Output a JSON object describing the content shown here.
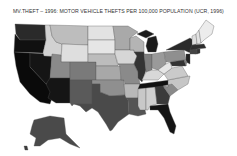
{
  "title": "MV.THEFT – 1996: MOTOR VEHICLE THEFTS PER 100,000 POPULATION (UCR, 1996)",
  "map": {
    "type": "choropleth",
    "region": "United States",
    "variable": "Motor vehicle thefts per 100,000 population",
    "source": "UCR, 1996",
    "shade_scale": {
      "lightest": "#eeeeee",
      "light": "#cfcfcf",
      "medium": "#9a9a9a",
      "dark": "#555555",
      "darkest": "#111111"
    },
    "states": {
      "WA": "#2a2a2a",
      "OR": "#101010",
      "CA": "#0a0a0a",
      "NV": "#151515",
      "ID": "#d2d2d2",
      "MT": "#bdbdbd",
      "WY": "#dedede",
      "UT": "#8a8a8a",
      "AZ": "#151515",
      "CO": "#7a7a7a",
      "NM": "#5a5a5a",
      "ND": "#e2e2e2",
      "SD": "#e6e6e6",
      "NE": "#bcbcbc",
      "KS": "#a8a8a8",
      "OK": "#8f8f8f",
      "TX": "#4a4a4a",
      "MN": "#a9a9a9",
      "IA": "#d6d6d6",
      "MO": "#8a8a8a",
      "AR": "#b8b8b8",
      "LA": "#555555",
      "WI": "#b4b4b4",
      "IL": "#333333",
      "MI": "#1a1a1a",
      "IN": "#7f7f7f",
      "OH": "#9a9a9a",
      "KY": "#d8d8d8",
      "TN": "#111111",
      "MS": "#c8c8c8",
      "AL": "#cfcfcf",
      "GA": "#3a3a3a",
      "FL": "#141414",
      "SC": "#8a8a8a",
      "NC": "#c6c6c6",
      "VA": "#cacaca",
      "WV": "#e6e6e6",
      "PA": "#8f8f8f",
      "NY": "#2a2a2a",
      "NJ": "#222222",
      "MD": "#333333",
      "DE": "#7a7a7a",
      "CT": "#444444",
      "RI": "#333333",
      "MA": "#2e2e2e",
      "VT": "#dedede",
      "NH": "#e2e2e2",
      "ME": "#ececec",
      "AK": "#4a4a4a",
      "HI": "#3a3a3a"
    }
  }
}
